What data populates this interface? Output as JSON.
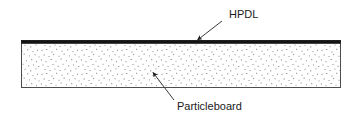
{
  "figure": {
    "background_color": "#ffffff",
    "panel": {
      "name": "layered-panel",
      "x": 21,
      "y": 40,
      "width": 320,
      "height": 48,
      "border_color": "#4d4d4d",
      "border_width": 1
    },
    "layers": [
      {
        "id": "hpdl",
        "label": "HPDL",
        "description": "high pressure decorative laminate facing layer",
        "fill_color": "#111111",
        "thickness_px": 3,
        "position": "top"
      },
      {
        "id": "particleboard",
        "label": "Particleboard",
        "description": "stippled particleboard core substrate",
        "fill_color": "#ffffff",
        "speckle_color": "#8c8c8c",
        "thickness_px": 45,
        "position": "core"
      }
    ],
    "callouts": [
      {
        "id": "hpdl-callout",
        "label": "HPDL",
        "text_x": 229,
        "text_y": 18,
        "leader_tail_x": 222,
        "leader_tail_y": 21,
        "leader_tip_x": 196,
        "leader_tip_y": 41,
        "line_color": "#3a3a3a",
        "arrow_direction": "down-left"
      },
      {
        "id": "particleboard-callout",
        "label": "Particleboard",
        "text_x": 177,
        "text_y": 110,
        "leader_tail_x": 174,
        "leader_tail_y": 100,
        "leader_tip_x": 152,
        "leader_tip_y": 71,
        "line_color": "#3a3a3a",
        "arrow_direction": "up-left"
      }
    ]
  }
}
